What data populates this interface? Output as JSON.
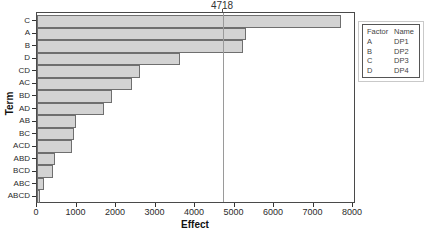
{
  "chart_data": {
    "type": "bar",
    "orientation": "horizontal",
    "title": "4718",
    "xlabel": "Effect",
    "ylabel": "Term",
    "categories": [
      "C",
      "A",
      "B",
      "D",
      "CD",
      "AC",
      "BD",
      "AD",
      "AB",
      "BC",
      "ACD",
      "ABD",
      "BCD",
      "ABC",
      "ABCD"
    ],
    "values": [
      7700,
      5280,
      5210,
      3620,
      2610,
      2400,
      1900,
      1700,
      990,
      940,
      890,
      450,
      410,
      180,
      80
    ],
    "xlim": [
      0,
      8000
    ],
    "x_ticks": [
      0,
      1000,
      2000,
      3000,
      4000,
      5000,
      6000,
      7000,
      8000
    ],
    "grid": false,
    "reference_line": {
      "value": 4718,
      "label": "4718"
    },
    "colors": {
      "bar_fill": "#d3d3d3",
      "bar_border": "#6f6f6f",
      "reference_line": "#9a9a9a",
      "frame": "#4a4a4a"
    },
    "legend": {
      "position": "top-right",
      "headers": [
        "Factor",
        "Name"
      ],
      "rows": [
        [
          "A",
          "DP1"
        ],
        [
          "B",
          "DP2"
        ],
        [
          "C",
          "DP3"
        ],
        [
          "D",
          "DP4"
        ]
      ]
    }
  }
}
